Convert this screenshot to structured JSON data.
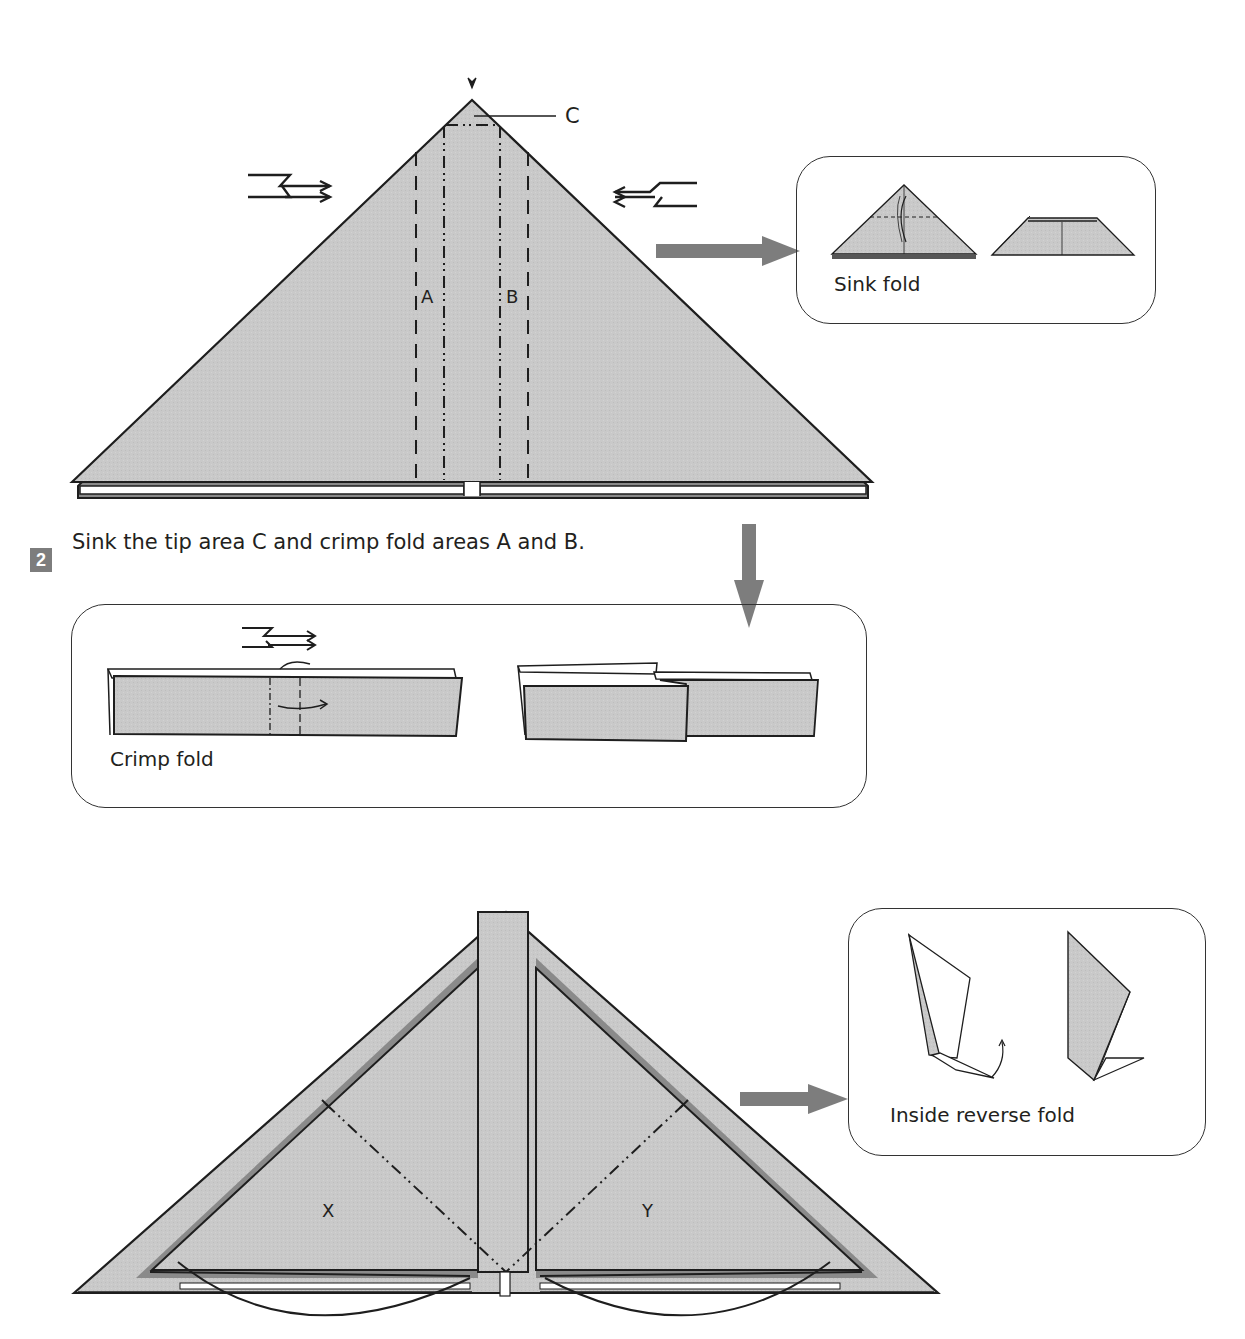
{
  "colors": {
    "paper": "#c8c8c8",
    "paper_dark": "#8a8a8a",
    "line": "#1e1e1e",
    "arrow": "#7d7d7d",
    "badge": "#7d7d7d"
  },
  "step1": {
    "labels": {
      "a": "A",
      "b": "B",
      "c": "C"
    },
    "inset": {
      "caption": "Sink fold"
    }
  },
  "step2": {
    "number": "2",
    "instruction": "Sink the tip area C and crimp fold areas A and B.",
    "inset": {
      "caption": "Crimp fold"
    }
  },
  "step3": {
    "labels": {
      "x": "X",
      "y": "Y"
    },
    "inset": {
      "caption": "Inside reverse fold"
    }
  },
  "icons": [
    "push-arrow-down-icon",
    "crimp-symbol-right-icon",
    "crimp-symbol-left-icon",
    "gray-arrow-right-icon",
    "gray-arrow-down-icon",
    "fold-arrow-icon"
  ]
}
